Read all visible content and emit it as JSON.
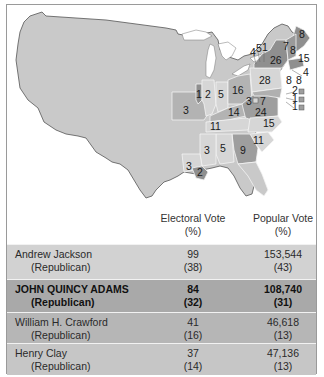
{
  "map": {
    "title": "Election of 1824",
    "colors": {
      "background_land": "#c9c9c9",
      "jackson": "#d6d6d6",
      "adams": "#8f8f8f",
      "crawford": "#9e9e9e",
      "clay": "#b3b3b3",
      "border": "#555555"
    },
    "state_labels": [
      {
        "state": "ME",
        "value": "8",
        "candidate": "adams"
      },
      {
        "state": "NH",
        "value": "8",
        "candidate": "adams"
      },
      {
        "state": "VT",
        "value": "7",
        "candidate": "adams"
      },
      {
        "state": "MA",
        "value": "15",
        "candidate": "adams"
      },
      {
        "state": "RI",
        "value": "4",
        "candidate": "adams"
      },
      {
        "state": "CT",
        "value": "8",
        "candidate": "adams"
      },
      {
        "state": "NY",
        "value": "26",
        "candidate": "adams"
      },
      {
        "state": "NY-Crawford",
        "value": "5",
        "candidate": "crawford"
      },
      {
        "state": "NY-Clay",
        "value": "4",
        "candidate": "clay"
      },
      {
        "state": "NY-Jackson",
        "value": "1",
        "candidate": "jackson"
      },
      {
        "state": "NJ",
        "value": "8",
        "candidate": "jackson"
      },
      {
        "state": "PA",
        "value": "28",
        "candidate": "jackson"
      },
      {
        "state": "DE-Crawford",
        "value": "2",
        "candidate": "crawford"
      },
      {
        "state": "DE-Adams",
        "value": "1",
        "candidate": "adams"
      },
      {
        "state": "MD-Adams",
        "value": "3",
        "candidate": "adams"
      },
      {
        "state": "MD-Jackson",
        "value": "7",
        "candidate": "jackson"
      },
      {
        "state": "MD-Crawford",
        "value": "1",
        "candidate": "crawford"
      },
      {
        "state": "VA",
        "value": "24",
        "candidate": "crawford"
      },
      {
        "state": "NC",
        "value": "15",
        "candidate": "jackson"
      },
      {
        "state": "SC",
        "value": "11",
        "candidate": "jackson"
      },
      {
        "state": "GA",
        "value": "9",
        "candidate": "crawford"
      },
      {
        "state": "OH",
        "value": "16",
        "candidate": "clay"
      },
      {
        "state": "KY",
        "value": "14",
        "candidate": "clay"
      },
      {
        "state": "TN",
        "value": "11",
        "candidate": "jackson"
      },
      {
        "state": "IN",
        "value": "5",
        "candidate": "jackson"
      },
      {
        "state": "IL-Adams",
        "value": "1",
        "candidate": "adams"
      },
      {
        "state": "IL-Jackson",
        "value": "2",
        "candidate": "jackson"
      },
      {
        "state": "MO",
        "value": "3",
        "candidate": "clay"
      },
      {
        "state": "AL",
        "value": "5",
        "candidate": "jackson"
      },
      {
        "state": "MS",
        "value": "3",
        "candidate": "jackson"
      },
      {
        "state": "LA-Jackson",
        "value": "3",
        "candidate": "jackson"
      },
      {
        "state": "LA-Adams",
        "value": "2",
        "candidate": "adams"
      }
    ]
  },
  "table": {
    "headers": {
      "electoral": "Electoral Vote",
      "electoral_unit": "(%)",
      "popular": "Popular Vote",
      "popular_unit": "(%)"
    },
    "rows": [
      {
        "name": "Andrew Jackson",
        "party": "(Republican)",
        "electoral": "99",
        "electoral_pct": "(38)",
        "popular": "153,544",
        "popular_pct": "(43)",
        "bg": "#d2d2d2",
        "winner": false
      },
      {
        "name": "JOHN QUINCY ADAMS",
        "party": "(Republican)",
        "electoral": "84",
        "electoral_pct": "(32)",
        "popular": "108,740",
        "popular_pct": "(31)",
        "bg": "#a9a9a9",
        "winner": true
      },
      {
        "name": "William H. Crawford",
        "party": "(Republican)",
        "electoral": "41",
        "electoral_pct": "(16)",
        "popular": "46,618",
        "popular_pct": "(13)",
        "bg": "#b6b6b6",
        "winner": false
      },
      {
        "name": "Henry Clay",
        "party": "(Republican)",
        "electoral": "37",
        "electoral_pct": "(14)",
        "popular": "47,136",
        "popular_pct": "(13)",
        "bg": "#c6c6c6",
        "winner": false
      }
    ]
  }
}
